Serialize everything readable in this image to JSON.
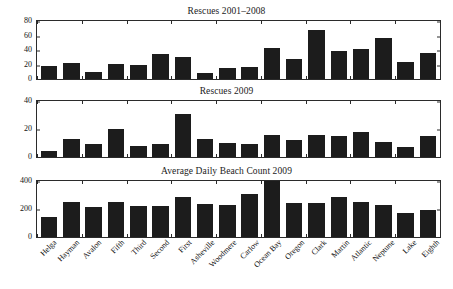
{
  "figure": {
    "width": 453,
    "height": 289,
    "background": "#ffffff",
    "bar_color": "#1c1c1c",
    "axis_color": "#2b2b2b",
    "text_color": "#111111"
  },
  "categories": [
    "Helga",
    "Hayman",
    "Avalon",
    "Fifth",
    "Third",
    "Second",
    "First",
    "Asheville",
    "Woodmere",
    "Carlow",
    "Ocean Bay",
    "Oregon",
    "Clark",
    "Martin",
    "Atlantic",
    "Neptune",
    "Lake",
    "Eighth"
  ],
  "panels": [
    {
      "id": "rescues-2001-2008",
      "title": "Rescues 2001–2008",
      "yticks": [
        "0",
        "20",
        "40",
        "60",
        "80"
      ]
    },
    {
      "id": "rescues-2009",
      "title": "Rescues 2009",
      "yticks": [
        "0",
        "20",
        "40"
      ]
    },
    {
      "id": "avg-daily-beach-count-2009",
      "title": "Average Daily Beach Count 2009",
      "yticks": [
        "0",
        "200",
        "400"
      ]
    }
  ],
  "chart_data": [
    {
      "type": "bar",
      "title": "Rescues 2001–2008",
      "xlabel": "",
      "ylabel": "",
      "ylim": [
        0,
        80
      ],
      "yticks": [
        0,
        20,
        40,
        60,
        80
      ],
      "grid": false,
      "legend": null,
      "categories": [
        "Helga",
        "Hayman",
        "Avalon",
        "Fifth",
        "Third",
        "Second",
        "First",
        "Asheville",
        "Woodmere",
        "Carlow",
        "Ocean Bay",
        "Oregon",
        "Clark",
        "Martin",
        "Atlantic",
        "Neptune",
        "Lake",
        "Eighth"
      ],
      "values": [
        18,
        22,
        10,
        21,
        20,
        34,
        30,
        8,
        15,
        17,
        43,
        28,
        67,
        39,
        41,
        56,
        24,
        36
      ]
    },
    {
      "type": "bar",
      "title": "Rescues 2009",
      "xlabel": "",
      "ylabel": "",
      "ylim": [
        0,
        40
      ],
      "yticks": [
        0,
        20,
        40
      ],
      "grid": false,
      "legend": null,
      "categories": [
        "Helga",
        "Hayman",
        "Avalon",
        "Fifth",
        "Third",
        "Second",
        "First",
        "Asheville",
        "Woodmere",
        "Carlow",
        "Ocean Bay",
        "Oregon",
        "Clark",
        "Martin",
        "Atlantic",
        "Neptune",
        "Lake",
        "Eighth"
      ],
      "values": [
        4,
        13,
        9,
        20,
        8,
        9,
        31,
        13,
        10,
        9,
        16,
        12,
        16,
        15,
        18,
        11,
        7,
        15
      ]
    },
    {
      "type": "bar",
      "title": "Average Daily Beach Count 2009",
      "xlabel": "",
      "ylabel": "",
      "ylim": [
        0,
        400
      ],
      "yticks": [
        0,
        200,
        400
      ],
      "grid": false,
      "legend": null,
      "categories": [
        "Helga",
        "Hayman",
        "Avalon",
        "Fifth",
        "Third",
        "Second",
        "First",
        "Asheville",
        "Woodmere",
        "Carlow",
        "Ocean Bay",
        "Oregon",
        "Clark",
        "Martin",
        "Atlantic",
        "Neptune",
        "Lake",
        "Eighth"
      ],
      "values": [
        140,
        248,
        215,
        250,
        218,
        225,
        283,
        233,
        232,
        305,
        400,
        243,
        240,
        285,
        248,
        232,
        170,
        193
      ]
    }
  ]
}
